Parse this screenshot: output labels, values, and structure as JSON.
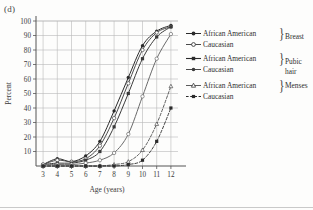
{
  "panel": {
    "label": "(d)"
  },
  "chart_data": {
    "type": "line",
    "title": "",
    "xlabel": "Age (years)",
    "ylabel": "Percent",
    "xlim": [
      2.5,
      12.5
    ],
    "ylim": [
      0,
      100
    ],
    "xticks": [
      3,
      4,
      5,
      6,
      7,
      8,
      9,
      10,
      11,
      12
    ],
    "yticks": [
      10,
      20,
      30,
      40,
      50,
      60,
      70,
      80,
      90,
      100
    ],
    "grid": true,
    "legend_position": "right",
    "x": [
      3,
      4,
      5,
      6,
      7,
      8,
      9,
      10,
      11,
      12
    ],
    "series": [
      {
        "name": "African American",
        "group": "Breast",
        "marker": "filled-circle",
        "dash": "solid",
        "color": "#2b2b2b",
        "values": [
          1,
          5,
          3,
          7,
          17,
          38,
          61,
          83,
          93,
          97
        ]
      },
      {
        "name": "Caucasian",
        "group": "Breast",
        "marker": "open-circle",
        "dash": "solid",
        "color": "#4a4a4a",
        "values": [
          1,
          4,
          3,
          5,
          14,
          33,
          57,
          80,
          92,
          96
        ]
      },
      {
        "name": "African American",
        "group": "Pubic hair",
        "marker": "filled-square",
        "dash": "solid",
        "color": "#3a3a3a",
        "values": [
          1,
          2,
          2,
          4,
          10,
          27,
          50,
          74,
          89,
          96
        ]
      },
      {
        "name": "Caucasian",
        "group": "Pubic hair",
        "marker": "open-circle",
        "dash": "solid",
        "color": "#6a6a6a",
        "values": [
          1,
          1,
          1,
          2,
          4,
          9,
          22,
          48,
          74,
          91
        ]
      },
      {
        "name": "African American",
        "group": "Menses",
        "marker": "open-triangle",
        "dash": "dashed",
        "color": "#4a4a4a",
        "values": [
          0,
          0,
          0,
          0,
          0,
          1,
          3,
          11,
          29,
          55
        ]
      },
      {
        "name": "Caucasian",
        "group": "Menses",
        "marker": "filled-square",
        "dash": "dashed",
        "color": "#2b2b2b",
        "values": [
          0,
          0,
          0,
          0,
          0,
          0,
          1,
          4,
          17,
          40
        ]
      }
    ],
    "legend_groups": [
      {
        "category": "Breast",
        "entries": [
          {
            "label": "African American",
            "marker": "filled-circle",
            "dash": "solid"
          },
          {
            "label": "Caucasian",
            "marker": "open-circle",
            "dash": "solid"
          }
        ]
      },
      {
        "category": "Pubic hair",
        "entries": [
          {
            "label": "African American",
            "marker": "filled-square",
            "dash": "solid"
          },
          {
            "label": "Caucasian",
            "marker": "filled-circle",
            "dash": "solid"
          }
        ]
      },
      {
        "category": "Menses",
        "entries": [
          {
            "label": "African American",
            "marker": "open-triangle",
            "dash": "solid"
          },
          {
            "label": "Caucasian",
            "marker": "filled-square",
            "dash": "dashed"
          }
        ]
      }
    ]
  },
  "legend": {
    "g0": {
      "cat": "Breast",
      "r0": "African American",
      "r1": "Caucasian"
    },
    "g1": {
      "cat": "Pubic",
      "cat2": "hair",
      "r0": "African American",
      "r1": "Caucasian"
    },
    "g2": {
      "cat": "Menses",
      "r0": "African American",
      "r1": "Caucasian"
    }
  },
  "colors": {
    "grid": "#b9b9b9",
    "axis": "#555555",
    "ink": "#2b2b2b",
    "background": "#fdfdfc"
  }
}
